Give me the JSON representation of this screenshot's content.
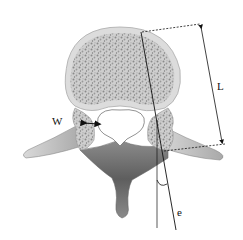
{
  "diagram": {
    "labels": {
      "width": "W",
      "length": "L",
      "angle": "e"
    },
    "colors": {
      "background": "#ffffff",
      "cortical_bone": "#c8c8c8",
      "cancellous_fill": "#bdbdbd",
      "cancellous_dots": "#8a8a8a",
      "shadow": "#555555",
      "lines": "#111111"
    }
  }
}
